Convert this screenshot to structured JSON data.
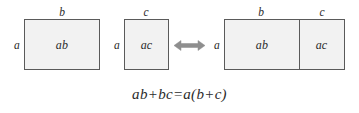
{
  "diagram": {
    "colors": {
      "fill": "#f2f2f2",
      "stroke": "#5a5a5a",
      "text": "#2b2b2b",
      "arrow": "#8a8a8a",
      "background": "#ffffff"
    },
    "left_group": {
      "rect_ab": {
        "inner_label": "ab",
        "top_label": "b",
        "side_label": "a"
      },
      "rect_ac": {
        "inner_label": "ac",
        "top_label": "c",
        "side_label": "a"
      }
    },
    "arrow": {
      "glyph": "double-headed-arrow",
      "direction": "both"
    },
    "right_group": {
      "side_label": "a",
      "parts": [
        {
          "inner_label": "ab",
          "top_label": "b"
        },
        {
          "inner_label": "ac",
          "top_label": "c"
        }
      ]
    },
    "equation": "ab+bc=a(b+c)"
  }
}
